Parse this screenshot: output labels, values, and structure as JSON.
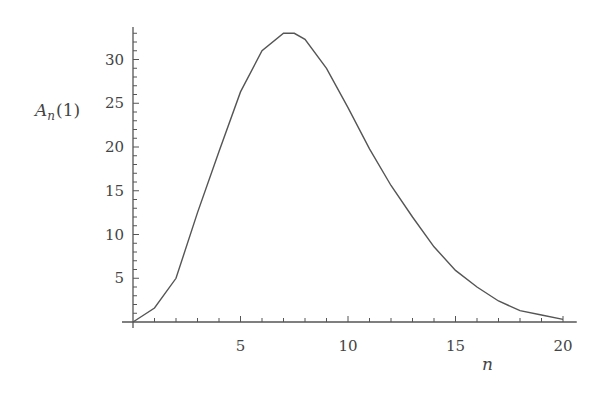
{
  "chart_data": {
    "type": "line",
    "title": "",
    "xlabel": "n",
    "ylabel": "A_n(1)",
    "ylabel_parts": {
      "base": "A",
      "sub": "n",
      "arg": "(1)"
    },
    "x": [
      0,
      1,
      2,
      3,
      4,
      5,
      6,
      7,
      7.5,
      8,
      9,
      10,
      11,
      12,
      13,
      14,
      15,
      16,
      17,
      18,
      19,
      20
    ],
    "series": [
      {
        "name": "A_n(1)",
        "values": [
          0,
          1.6,
          5.0,
          12.5,
          19.5,
          26.3,
          31.0,
          33.0,
          33.0,
          32.3,
          29.0,
          24.5,
          19.8,
          15.6,
          12.0,
          8.6,
          5.9,
          4.0,
          2.4,
          1.3,
          0.8,
          0.3
        ]
      }
    ],
    "xlim": [
      0,
      20.5
    ],
    "ylim": [
      0,
      34
    ],
    "xticks": [
      5,
      10,
      15,
      20
    ],
    "xtick_labels": [
      "5",
      "10",
      "15",
      "20"
    ],
    "yticks": [
      5,
      10,
      15,
      20,
      25,
      30
    ],
    "ytick_labels": [
      "5",
      "10",
      "15",
      "20",
      "25",
      "30"
    ],
    "x_minor_step": 1,
    "y_minor_step": 1,
    "grid": false,
    "legend": null,
    "line_color": "#555555"
  }
}
